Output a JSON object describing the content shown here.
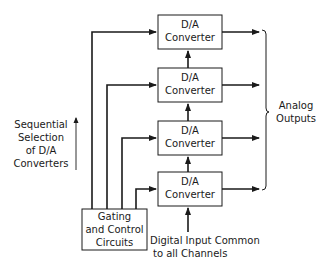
{
  "diagram": {
    "converters": [
      {
        "line1": "D/A",
        "line2": "Converter"
      },
      {
        "line1": "D/A",
        "line2": "Converter"
      },
      {
        "line1": "D/A",
        "line2": "Converter"
      },
      {
        "line1": "D/A",
        "line2": "Converter"
      }
    ],
    "gating": {
      "line1": "Gating",
      "line2": "and Control",
      "line3": "Circuits"
    },
    "sequential": {
      "line1": "Sequential",
      "line2": "Selection",
      "line3": "of D/A",
      "line4": "Converters"
    },
    "analog": {
      "line1": "Analog",
      "line2": "Outputs"
    },
    "digital": {
      "line1": "Digital Input Common",
      "line2": "to all Channels"
    },
    "colors": {
      "stroke": "#1a1a1a",
      "background": "#ffffff"
    }
  }
}
